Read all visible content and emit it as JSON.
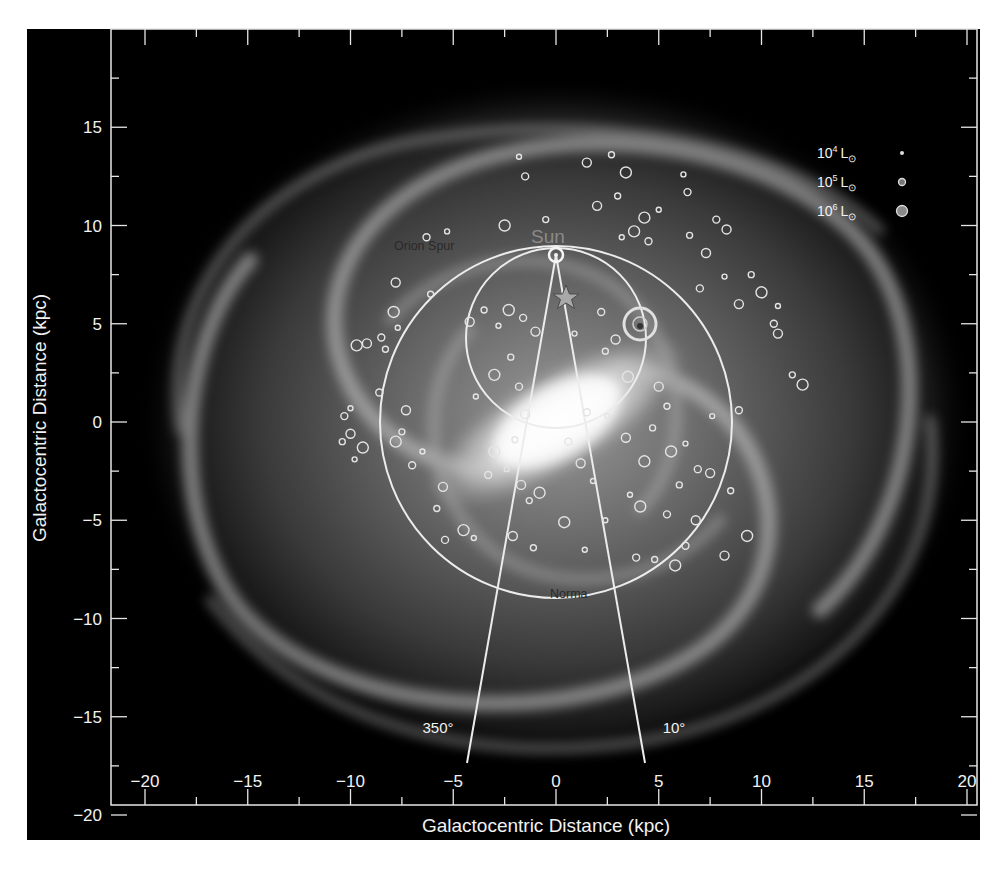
{
  "chart_data": {
    "type": "scatter",
    "title": "",
    "subtitle": "Milky Way face-on map with luminous star-forming regions",
    "xlabel": "Galactocentric Distance (kpc)",
    "ylabel": "Galactocentric Distance (kpc)",
    "xlim": [
      -21.5,
      20.5
    ],
    "ylim": [
      -20,
      19.5
    ],
    "xticks": [
      -20,
      -15,
      -10,
      -5,
      0,
      5,
      10,
      15,
      20
    ],
    "yticks": [
      -20,
      -15,
      -10,
      -5,
      0,
      5,
      10,
      15
    ],
    "xtick_labels": [
      "−20",
      "−15",
      "−10",
      "−5",
      "0",
      "5",
      "10",
      "15",
      "20"
    ],
    "ytick_labels": [
      "−20",
      "−15",
      "−10",
      "−5",
      "0",
      "5",
      "10",
      "15"
    ],
    "grid": false,
    "background": "artist's-impression galaxy image (grayscale spiral with central bar)",
    "legend": {
      "position": "upper right",
      "entries": [
        {
          "label_base": "10",
          "label_exp": "4",
          "label_unit": "L",
          "sun_symbol": "⊙",
          "marker_size": 2
        },
        {
          "label_base": "10",
          "label_exp": "5",
          "label_unit": "L",
          "sun_symbol": "⊙",
          "marker_size": 3.5
        },
        {
          "label_base": "10",
          "label_exp": "6",
          "label_unit": "L",
          "sun_symbol": "⊙",
          "marker_size": 5.5
        }
      ]
    },
    "annotations": [
      {
        "text": "Sun",
        "x": 0,
        "y": 9.0
      },
      {
        "text": "Orion Spur",
        "x": -7.5,
        "y": 8.8
      },
      {
        "text": "Norma",
        "x": 0.9,
        "y": -8.8
      },
      {
        "text": "350°",
        "x": -5.8,
        "y": -15.5
      },
      {
        "text": "10°",
        "x": 5.7,
        "y": -15.5
      }
    ],
    "overlays": {
      "sun_position": {
        "x": 0,
        "y": 8.5
      },
      "galactic_center": {
        "x": 0,
        "y": 0
      },
      "solar_circle": {
        "cx": 0,
        "cy": 0,
        "r": 8.5
      },
      "tangent_circle": {
        "cx": 0,
        "cy": 4.25,
        "r": 4.35
      },
      "longitude_lines": [
        {
          "label": "350°",
          "from": [
            0,
            8.5
          ],
          "to": [
            -4.3,
            -15.9
          ]
        },
        {
          "label": "10°",
          "from": [
            0,
            8.5
          ],
          "to": [
            4.3,
            -15.9
          ]
        }
      ],
      "star_marker": {
        "x": 0.5,
        "y": 6.3
      },
      "bright_source": {
        "x": 4.1,
        "y": 5.0,
        "luminosity": "10^6 L⊙"
      }
    },
    "series": [
      {
        "name": "HII regions / star-forming complexes",
        "points": [
          [
            -1.8,
            13.5
          ],
          [
            -1.5,
            12.5
          ],
          [
            1.5,
            13.2
          ],
          [
            2.7,
            13.6
          ],
          [
            3.4,
            12.7
          ],
          [
            6.2,
            12.6
          ],
          [
            6.4,
            11.7
          ],
          [
            2.0,
            11.0
          ],
          [
            3.0,
            11.5
          ],
          [
            4.3,
            10.4
          ],
          [
            5.0,
            10.8
          ],
          [
            7.8,
            10.3
          ],
          [
            8.3,
            9.8
          ],
          [
            6.5,
            9.5
          ],
          [
            3.8,
            9.7
          ],
          [
            3.2,
            9.4
          ],
          [
            4.5,
            9.2
          ],
          [
            7.3,
            8.6
          ],
          [
            9.5,
            7.5
          ],
          [
            10.0,
            6.6
          ],
          [
            10.8,
            5.9
          ],
          [
            10.6,
            5.0
          ],
          [
            10.8,
            4.5
          ],
          [
            11.5,
            2.4
          ],
          [
            12.0,
            1.9
          ],
          [
            8.2,
            7.4
          ],
          [
            7.0,
            6.8
          ],
          [
            8.9,
            6.0
          ],
          [
            -0.5,
            10.3
          ],
          [
            -2.5,
            10.0
          ],
          [
            -5.3,
            9.7
          ],
          [
            -6.3,
            9.4
          ],
          [
            -7.8,
            7.1
          ],
          [
            -6.1,
            6.5
          ],
          [
            -7.9,
            5.6
          ],
          [
            -7.7,
            4.8
          ],
          [
            -8.5,
            4.3
          ],
          [
            -9.2,
            4.0
          ],
          [
            -8.3,
            3.7
          ],
          [
            -9.7,
            3.9
          ],
          [
            -10.0,
            0.7
          ],
          [
            -10.3,
            0.3
          ],
          [
            -10.0,
            -0.6
          ],
          [
            -10.4,
            -1.0
          ],
          [
            -9.4,
            -1.3
          ],
          [
            -9.8,
            -1.9
          ],
          [
            -8.6,
            1.5
          ],
          [
            -7.3,
            0.6
          ],
          [
            -7.5,
            -0.5
          ],
          [
            -7.8,
            -1.0
          ],
          [
            -6.5,
            -1.5
          ],
          [
            -7.0,
            -2.2
          ],
          [
            -5.5,
            -3.3
          ],
          [
            -5.8,
            -4.4
          ],
          [
            -4.5,
            -5.5
          ],
          [
            -4.0,
            -5.9
          ],
          [
            -5.4,
            -6.0
          ],
          [
            -4.2,
            5.1
          ],
          [
            -3.5,
            5.7
          ],
          [
            -2.3,
            5.7
          ],
          [
            -2.8,
            4.9
          ],
          [
            -1.6,
            5.3
          ],
          [
            -1.0,
            4.6
          ],
          [
            -2.2,
            3.3
          ],
          [
            -3.0,
            2.4
          ],
          [
            -3.9,
            1.3
          ],
          [
            -1.8,
            1.8
          ],
          [
            -1.5,
            0.4
          ],
          [
            -2.0,
            -0.9
          ],
          [
            -3.0,
            -1.5
          ],
          [
            -2.4,
            -2.4
          ],
          [
            -3.3,
            -2.7
          ],
          [
            -1.7,
            -3.2
          ],
          [
            -1.3,
            -4.0
          ],
          [
            -0.8,
            -3.6
          ],
          [
            0.9,
            4.5
          ],
          [
            2.2,
            5.6
          ],
          [
            2.9,
            4.2
          ],
          [
            2.4,
            3.6
          ],
          [
            3.5,
            2.3
          ],
          [
            2.5,
            0.3
          ],
          [
            1.5,
            0.5
          ],
          [
            3.4,
            -0.8
          ],
          [
            4.7,
            -0.3
          ],
          [
            5.6,
            -1.5
          ],
          [
            6.3,
            -1.1
          ],
          [
            6.9,
            -2.4
          ],
          [
            7.5,
            -2.6
          ],
          [
            6.0,
            -3.2
          ],
          [
            4.1,
            -4.3
          ],
          [
            3.6,
            -3.7
          ],
          [
            5.4,
            -4.7
          ],
          [
            6.8,
            -5.0
          ],
          [
            8.5,
            -3.5
          ],
          [
            9.3,
            -5.8
          ],
          [
            7.6,
            0.3
          ],
          [
            8.9,
            0.6
          ],
          [
            5.0,
            1.8
          ],
          [
            5.4,
            0.8
          ],
          [
            4.3,
            -2.0
          ],
          [
            2.4,
            -5.0
          ],
          [
            6.3,
            -6.3
          ],
          [
            8.2,
            -6.8
          ],
          [
            4.8,
            -7.0
          ],
          [
            5.8,
            -7.3
          ],
          [
            1.4,
            -6.5
          ],
          [
            3.9,
            -6.9
          ],
          [
            -2.1,
            -5.8
          ],
          [
            -1.1,
            -6.4
          ],
          [
            0.4,
            -5.1
          ],
          [
            1.8,
            -3.0
          ],
          [
            0.6,
            -1.0
          ],
          [
            1.2,
            -2.1
          ]
        ]
      }
    ]
  },
  "figure": {
    "background_color": "#000000",
    "axis_color": "#e6e6e6",
    "text_color": "#f2f2f2",
    "annotation_dark_color": "#2a2a2a",
    "sun_label_color": "#8a8a8a"
  }
}
